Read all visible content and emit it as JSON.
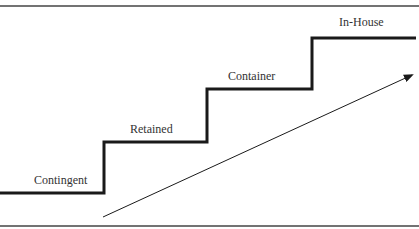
{
  "diagram": {
    "type": "staircase",
    "colors": {
      "line": "#1a1a1a",
      "rule": "#444444",
      "text": "#333333",
      "background": "#ffffff"
    },
    "steps": [
      {
        "label": "Contingent",
        "level_y": 193,
        "x_start": 0,
        "x_end": 104,
        "label_x": 34,
        "label_y": 184
      },
      {
        "label": "Retained",
        "level_y": 142,
        "x_start": 104,
        "x_end": 207,
        "label_x": 130,
        "label_y": 133
      },
      {
        "label": "Container",
        "level_y": 89,
        "x_start": 207,
        "x_end": 312,
        "label_x": 228,
        "label_y": 80
      },
      {
        "label": "In-House",
        "level_y": 38,
        "x_start": 312,
        "x_end": 416,
        "label_x": 339,
        "label_y": 26
      }
    ],
    "arrow": {
      "x1": 103,
      "y1": 217,
      "x2": 414,
      "y2": 74,
      "meaning": "increasing progression"
    },
    "rules": {
      "top_y": 6,
      "bottom_y": 226
    }
  }
}
